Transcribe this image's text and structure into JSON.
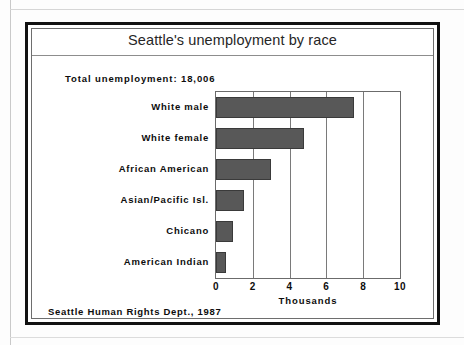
{
  "figure": {
    "title": "Seattle's unemployment by race",
    "annotation_total": "Total unemployment: 18,006",
    "source": "Seattle Human Rights Dept., 1987"
  },
  "colors": {
    "bar_fill": "#585858",
    "bar_border": "#3a3a3a",
    "frame": "#111111",
    "gridline": "#7a7a7a",
    "text": "#0d0d0d",
    "title_text": "#262626",
    "background": "#ffffff"
  },
  "chart_data": {
    "type": "bar",
    "orientation": "horizontal",
    "title": "Seattle's unemployment by race",
    "subtitle": "Total unemployment: 18,006",
    "categories": [
      "White male",
      "White female",
      "African American",
      "Asian/Pacific Isl.",
      "Chicano",
      "American Indian"
    ],
    "values": [
      7.5,
      4.8,
      3.0,
      1.5,
      0.95,
      0.55
    ],
    "xlabel": "Thousands",
    "ylabel": "",
    "xlim": [
      0,
      10
    ],
    "xticks": [
      0,
      2,
      4,
      6,
      8,
      10
    ],
    "xticklabels": [
      "0",
      "2",
      "4",
      "6",
      "8",
      "10"
    ],
    "grid": "vertical",
    "legend": "none",
    "annotations": [
      "Total unemployment: 18,006",
      "Seattle Human Rights Dept., 1987"
    ]
  }
}
